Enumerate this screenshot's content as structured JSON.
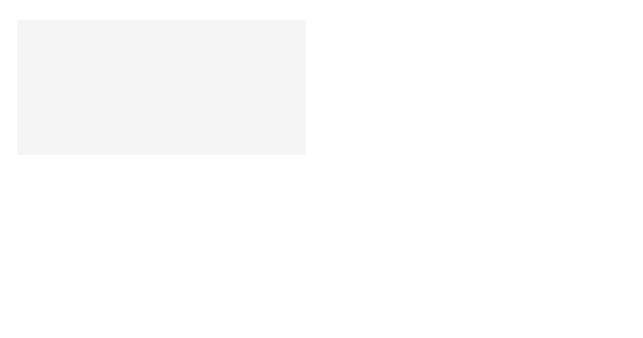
{
  "figure": {
    "panels": [
      {
        "id": "A",
        "letter": "A",
        "title": "Apoplast",
        "labels": [
          "Sucrose",
          "Sucrose",
          "Sucrose",
          "Sucrose",
          "Sucrose",
          "Sucrose"
        ],
        "description": "Apoplastic loading: sucrose exits sieve element/companion cell complex into apoplast, and moves into mesophyll cells"
      },
      {
        "id": "B",
        "letter": "B",
        "title": "Apoplast",
        "labels": [
          "Sucrose",
          "Sucrose",
          "Sucrose",
          "Sucrose",
          "Sucrose",
          "Sucrose"
        ],
        "description": "Symplastic loading: sucrose moves cell-to-cell through plasmodesmata"
      }
    ],
    "colors": {
      "background": "#ffffff",
      "cell_fill": "#e6e6e6",
      "nucleus": "#9a9a9a",
      "sieve_element": "#d9d9d9",
      "companion_cell": "#8c8c8c",
      "arrow": "#1a1a1a"
    }
  }
}
